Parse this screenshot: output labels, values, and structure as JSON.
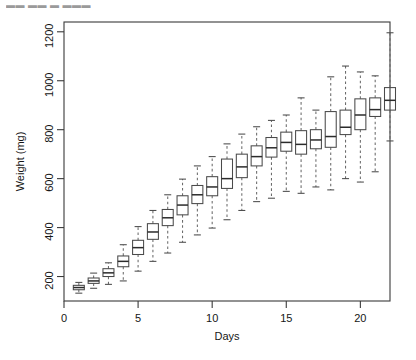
{
  "page": {
    "top_fragment": "▬▬   ▬▬ ▬ ▬▬▬",
    "background": "#ffffff",
    "foreground": "#1a1a1a"
  },
  "chart_data": {
    "type": "box",
    "title": "",
    "xlabel": "Days",
    "ylabel": "Weight (mg)",
    "xlim": [
      0,
      22
    ],
    "ylim": [
      100,
      1240
    ],
    "grid": false,
    "legend": null,
    "xticks": [
      0,
      5,
      10,
      15,
      20
    ],
    "yticks": [
      200,
      400,
      600,
      800,
      1000,
      1200
    ],
    "xtick_labels": [
      "0",
      "5",
      "10",
      "15",
      "20"
    ],
    "ytick_labels": [
      "200",
      "400",
      "600",
      "800",
      "1000",
      "1200"
    ],
    "categories": [
      1,
      2,
      3,
      4,
      5,
      6,
      7,
      8,
      9,
      10,
      11,
      12,
      13,
      14,
      15,
      16,
      17,
      18,
      19,
      20,
      21
    ],
    "boxes": [
      {
        "x": 1,
        "whisker_low": 132,
        "q1": 146,
        "median": 155,
        "q3": 164,
        "whisker_high": 176
      },
      {
        "x": 2,
        "whisker_low": 152,
        "q1": 172,
        "median": 182,
        "q3": 194,
        "whisker_high": 214
      },
      {
        "x": 3,
        "whisker_low": 168,
        "q1": 200,
        "median": 215,
        "q3": 232,
        "whisker_high": 256
      },
      {
        "x": 4,
        "whisker_low": 182,
        "q1": 240,
        "median": 262,
        "q3": 284,
        "whisker_high": 330
      },
      {
        "x": 5,
        "whisker_low": 222,
        "q1": 290,
        "median": 318,
        "q3": 348,
        "whisker_high": 404
      },
      {
        "x": 6,
        "whisker_low": 262,
        "q1": 352,
        "median": 382,
        "q3": 416,
        "whisker_high": 470
      },
      {
        "x": 7,
        "whisker_low": 296,
        "q1": 408,
        "median": 440,
        "q3": 474,
        "whisker_high": 534
      },
      {
        "x": 8,
        "whisker_low": 340,
        "q1": 452,
        "median": 492,
        "q3": 530,
        "whisker_high": 598
      },
      {
        "x": 9,
        "whisker_low": 370,
        "q1": 498,
        "median": 534,
        "q3": 572,
        "whisker_high": 652
      },
      {
        "x": 10,
        "whisker_low": 398,
        "q1": 530,
        "median": 566,
        "q3": 608,
        "whisker_high": 690
      },
      {
        "x": 11,
        "whisker_low": 432,
        "q1": 560,
        "median": 600,
        "q3": 680,
        "whisker_high": 742
      },
      {
        "x": 12,
        "whisker_low": 470,
        "q1": 604,
        "median": 648,
        "q3": 700,
        "whisker_high": 782
      },
      {
        "x": 13,
        "whisker_low": 506,
        "q1": 652,
        "median": 690,
        "q3": 734,
        "whisker_high": 812
      },
      {
        "x": 14,
        "whisker_low": 520,
        "q1": 688,
        "median": 726,
        "q3": 768,
        "whisker_high": 838
      },
      {
        "x": 15,
        "whisker_low": 548,
        "q1": 712,
        "median": 748,
        "q3": 790,
        "whisker_high": 860
      },
      {
        "x": 16,
        "whisker_low": 540,
        "q1": 700,
        "median": 740,
        "q3": 796,
        "whisker_high": 930
      },
      {
        "x": 17,
        "whisker_low": 566,
        "q1": 722,
        "median": 758,
        "q3": 800,
        "whisker_high": 880
      },
      {
        "x": 18,
        "whisker_low": 554,
        "q1": 728,
        "median": 772,
        "q3": 874,
        "whisker_high": 1016
      },
      {
        "x": 19,
        "whisker_low": 600,
        "q1": 780,
        "median": 810,
        "q3": 880,
        "whisker_high": 1060
      },
      {
        "x": 20,
        "whisker_low": 586,
        "q1": 800,
        "median": 860,
        "q3": 926,
        "whisker_high": 1036
      },
      {
        "x": 21,
        "whisker_low": 628,
        "q1": 854,
        "median": 882,
        "q3": 930,
        "whisker_high": 1020
      },
      {
        "x": 22,
        "whisker_low": 754,
        "q1": 880,
        "median": 920,
        "q3": 972,
        "whisker_high": 1196
      }
    ]
  }
}
